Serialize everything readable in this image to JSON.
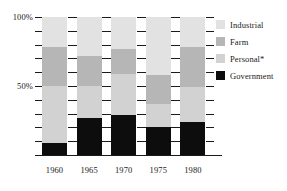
{
  "chart_data": {
    "type": "bar",
    "subtype": "stacked-100-percent",
    "title": "",
    "xlabel": "",
    "ylabel": "",
    "categories": [
      "1960",
      "1965",
      "1970",
      "1975",
      "1980"
    ],
    "ylim": [
      0,
      100
    ],
    "ytick_labels": [
      "50%",
      "100%"
    ],
    "ytick_values": [
      50,
      100
    ],
    "grid": false,
    "legend_position": "right",
    "series": [
      {
        "name": "Industrial",
        "color": "#e2e2e2",
        "values": [
          22,
          28,
          23,
          42,
          22
        ]
      },
      {
        "name": "Farm",
        "color": "#b6b6b6",
        "values": [
          28,
          22,
          18,
          21,
          29
        ]
      },
      {
        "name": "Personal*",
        "color": "#d2d2d2",
        "values": [
          41,
          23,
          30,
          17,
          25
        ]
      },
      {
        "name": "Government",
        "color": "#0d0d0d",
        "values": [
          9,
          27,
          29,
          20,
          24
        ]
      }
    ],
    "stack_order_top_to_bottom": [
      "Industrial",
      "Farm",
      "Personal*",
      "Government"
    ],
    "annotations": [
      "*"
    ]
  },
  "axis": {
    "y_labels": [
      {
        "text": "100%",
        "value": 100
      },
      {
        "text": "50%",
        "value": 50
      }
    ],
    "x_labels": [
      "1960",
      "1965",
      "1970",
      "1975",
      "1980"
    ]
  },
  "legend": {
    "items": [
      {
        "label": "Industrial",
        "color": "#e2e2e2"
      },
      {
        "label": "Farm",
        "color": "#b6b6b6"
      },
      {
        "label": "Personal*",
        "color": "#d2d2d2"
      },
      {
        "label": "Government",
        "color": "#0d0d0d"
      }
    ]
  }
}
